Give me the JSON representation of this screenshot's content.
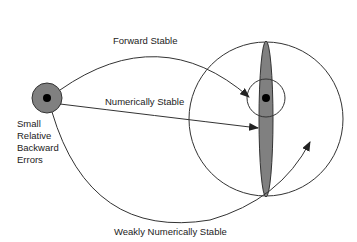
{
  "diagram": {
    "source_label": [
      "Small",
      "Relative",
      "Backward",
      "Errors"
    ],
    "arrows": {
      "forward": "Forward Stable",
      "numerical": "Numerically Stable",
      "weak": "Weakly Numerically Stable"
    },
    "colors": {
      "fill": "#808080",
      "stroke": "#333333",
      "dot": "#000000"
    }
  }
}
